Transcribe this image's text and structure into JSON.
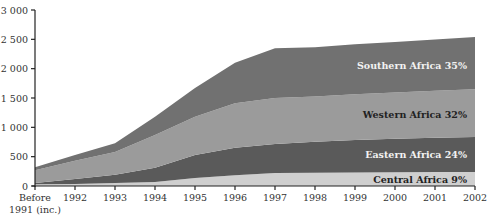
{
  "chart_data": {
    "type": "area",
    "stacked": true,
    "title": "",
    "xlabel": "",
    "ylabel": "",
    "ylim": [
      0,
      3000
    ],
    "yticks": [
      0,
      500,
      1000,
      1500,
      2000,
      2500,
      3000
    ],
    "ytick_labels": [
      "0",
      "500",
      "1 000",
      "1 500",
      "2 000",
      "2 500",
      "3 000"
    ],
    "categories": [
      "Before 1991 (inc.)",
      "1992",
      "1993",
      "1994",
      "1995",
      "1996",
      "1997",
      "1998",
      "1999",
      "2000",
      "2001",
      "2002"
    ],
    "xtick_labels": [
      [
        "Before",
        "1991 (inc.)"
      ],
      [
        "1992"
      ],
      [
        "1993"
      ],
      [
        "1994"
      ],
      [
        "1995"
      ],
      [
        "1996"
      ],
      [
        "1997"
      ],
      [
        "1998"
      ],
      [
        "1999"
      ],
      [
        "2000"
      ],
      [
        "2001"
      ],
      [
        "2002"
      ]
    ],
    "series": [
      {
        "name": "Central Africa",
        "share_label": "Central Africa 9%",
        "color": "#cfcfcf",
        "label_color": "#222222",
        "values": [
          30,
          35,
          50,
          70,
          135,
          185,
          220,
          225,
          230,
          235,
          238,
          240
        ]
      },
      {
        "name": "Eastern Africa",
        "share_label": "Eastern Africa 24%",
        "color": "#5a5a5a",
        "label_color": "#f2f2f2",
        "values": [
          20,
          85,
          140,
          240,
          395,
          465,
          495,
          530,
          555,
          570,
          585,
          595
        ]
      },
      {
        "name": "Western Africa",
        "share_label": "Western Africa 32%",
        "color": "#9b9b9b",
        "label_color": "#222222",
        "values": [
          220,
          310,
          390,
          560,
          650,
          760,
          785,
          770,
          780,
          790,
          800,
          815
        ]
      },
      {
        "name": "Southern Africa",
        "share_label": "Southern Africa 35%",
        "color": "#717171",
        "label_color": "#f2f2f2",
        "values": [
          50,
          100,
          150,
          310,
          490,
          690,
          850,
          840,
          850,
          860,
          875,
          890
        ]
      }
    ],
    "cumulative_totals": [
      320,
      530,
      730,
      1180,
      1670,
      2100,
      2350,
      2365,
      2415,
      2455,
      2498,
      2540
    ],
    "legend_position": "inline-right",
    "grid": false
  }
}
